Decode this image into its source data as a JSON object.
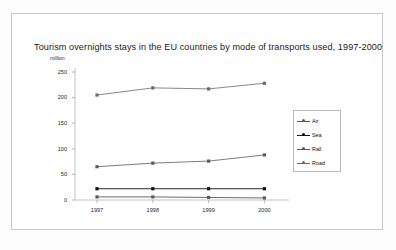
{
  "figure": {
    "title": "Tourism overnights stays in the EU countries by mode of transports used, 1997-2000",
    "y_unit_label": "million"
  },
  "legend": {
    "position": "right",
    "entries": [
      {
        "label": "Air",
        "color": "#5a5a5a"
      },
      {
        "label": "Sea",
        "color": "#101010"
      },
      {
        "label": "Rail",
        "color": "#5a5a5a"
      },
      {
        "label": "Road",
        "color": "#6a6a6a"
      }
    ]
  },
  "axes": {
    "y_ticks": [
      "250",
      "200",
      "150",
      "100",
      "50",
      "0"
    ],
    "x_ticks": [
      "1997",
      "1998",
      "1999",
      "2000"
    ]
  },
  "chart_data": {
    "type": "line",
    "title": "Tourism overnights stays in the EU countries by mode of transports used, 1997-2000",
    "xlabel": "",
    "ylabel": "million",
    "categories": [
      "1997",
      "1998",
      "1999",
      "2000"
    ],
    "ylim": [
      0,
      250
    ],
    "ytick_step": 50,
    "grid": false,
    "legend_position": "right",
    "series": [
      {
        "name": "Air",
        "values": [
          65,
          72,
          76,
          88
        ],
        "color": "#5a5a5a"
      },
      {
        "name": "Sea",
        "values": [
          22,
          22,
          22,
          22
        ],
        "color": "#101010"
      },
      {
        "name": "Rail",
        "values": [
          6,
          6,
          5,
          4
        ],
        "color": "#5a5a5a"
      },
      {
        "name": "Road",
        "values": [
          205,
          219,
          217,
          228
        ],
        "color": "#6a6a6a"
      }
    ]
  }
}
